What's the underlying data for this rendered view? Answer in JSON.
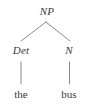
{
  "figure": {
    "kind": "syntax-tree",
    "background_color": "#ffffff",
    "line_color": "#8a8a8a",
    "text_color": "#3a3a3a"
  },
  "tree": {
    "root": {
      "label": "NP",
      "style": "italic",
      "x": 47,
      "y": 17
    },
    "nonterminals": [
      {
        "id": "det",
        "label": "Det",
        "style": "italic",
        "x": 21,
        "y": 56
      },
      {
        "id": "n",
        "label": "N",
        "style": "italic",
        "x": 69,
        "y": 56
      }
    ],
    "terminals": [
      {
        "id": "the",
        "label": "the",
        "style": "roman",
        "parent": "det",
        "x": 21,
        "y": 100
      },
      {
        "id": "bus",
        "label": "bus",
        "style": "roman",
        "parent": "n",
        "x": 69,
        "y": 100
      }
    ],
    "edges": [
      {
        "from": "NP",
        "to": "Det",
        "type": "diagonal",
        "x1": 46,
        "y1": 22,
        "x2": 21,
        "y2": 41
      },
      {
        "from": "NP",
        "to": "N",
        "type": "diagonal",
        "x1": 46,
        "y1": 22,
        "x2": 70,
        "y2": 41
      },
      {
        "from": "Det",
        "to": "the",
        "type": "vertical",
        "x1": 21,
        "y1": 62,
        "x2": 21,
        "y2": 84
      },
      {
        "from": "N",
        "to": "bus",
        "type": "vertical",
        "x1": 69,
        "y1": 62,
        "x2": 69,
        "y2": 84
      }
    ]
  }
}
